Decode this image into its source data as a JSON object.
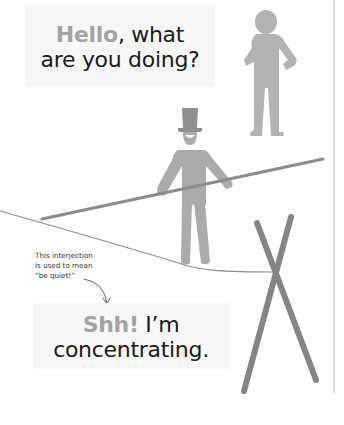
{
  "speech_top": {
    "accent_word": "Hello",
    "rest_line1": ", what",
    "line2": "are you doing?"
  },
  "annotation": {
    "line1": "This interjection",
    "line2": "is used to mean",
    "line3": "“be quiet!”"
  },
  "speech_bottom": {
    "accent_word": "Shh!",
    "rest_line1": " I’m",
    "line2": "concentrating."
  },
  "colors": {
    "figure_gray": "#a9a9a9",
    "pole_gray": "#8c8c8c",
    "accent_gray": "#a3a3a3",
    "text_dark": "#1a1a1a",
    "bubble_bg": "#f7f7f7",
    "rule": "#dcdcdc"
  },
  "icons": {
    "standing_figure": "person-hands-on-hips-icon",
    "tightrope_walker": "person-top-hat-icon",
    "pointer": "curved-arrow-icon"
  }
}
